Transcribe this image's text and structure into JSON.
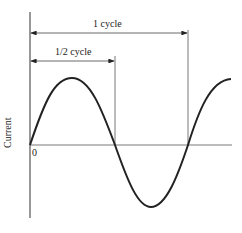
{
  "diagram": {
    "type": "sine-wave",
    "y_axis_label": "Current",
    "origin_label": "0",
    "annotations": [
      {
        "label": "1 cycle",
        "from": "0",
        "to": "full period"
      },
      {
        "label": "1/2 cycle",
        "from": "0",
        "to": "half period"
      }
    ]
  }
}
